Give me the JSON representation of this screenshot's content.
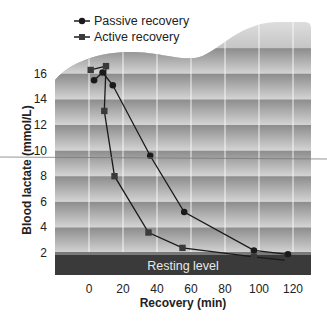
{
  "chart_data": {
    "type": "line",
    "title": "",
    "xlabel": "Recovery (min)",
    "ylabel": "Blood lactate (mmol/L)",
    "xlim": [
      -15,
      130
    ],
    "ylim": [
      0.4,
      17
    ],
    "x_ticks": [
      0,
      20,
      40,
      60,
      80,
      100,
      120
    ],
    "y_ticks": [
      2,
      4,
      6,
      8,
      10,
      12,
      14,
      16
    ],
    "grid": true,
    "legend_position": "top-left",
    "series": [
      {
        "name": "Passive recovery",
        "marker": "circle",
        "x": [
          3,
          8,
          14,
          36,
          56,
          97,
          117
        ],
        "y": [
          15.5,
          16.1,
          15.1,
          9.6,
          5.2,
          2.2,
          1.9
        ]
      },
      {
        "name": "Active recovery",
        "marker": "square",
        "x": [
          1,
          10,
          9,
          15,
          35,
          55,
          97,
          117
        ],
        "y": [
          16.3,
          16.6,
          13.1,
          8.0,
          3.6,
          2.4,
          1.7,
          1.4
        ]
      }
    ],
    "annotations": [
      {
        "text": "Resting level",
        "type": "band",
        "y_range": [
          0.4,
          1.8
        ]
      }
    ]
  },
  "legend": {
    "passive": "Passive recovery",
    "active": "Active recovery"
  },
  "axes": {
    "x_title": "Recovery (min)",
    "y_title": "Blood lactate (mmol/L)"
  },
  "band": {
    "label": "Resting level"
  },
  "colors": {
    "line": "#1a1a1a",
    "resting_band": "#3a3a3a",
    "grid": "#ffffff"
  }
}
